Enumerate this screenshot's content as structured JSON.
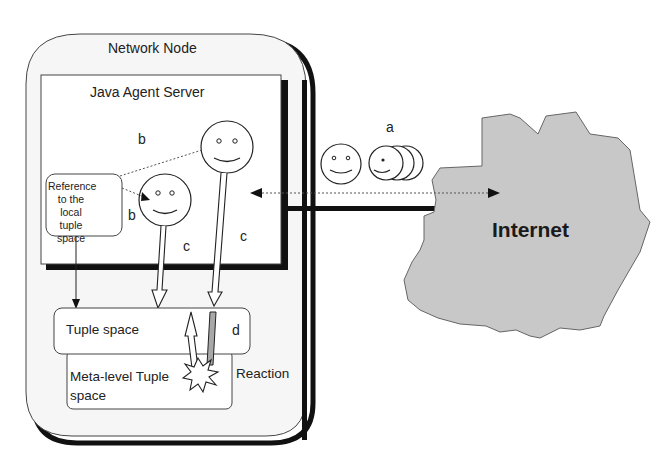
{
  "diagram": {
    "network_node": {
      "label": "Network Node"
    },
    "java_agent_server": {
      "label": "Java Agent Server"
    },
    "reference_box": {
      "label": "Reference to the local tuple space"
    },
    "tuple_space": {
      "label": "Tuple space"
    },
    "meta_level_tuple_space": {
      "label": "Meta-level Tuple space"
    },
    "reaction": {
      "label": "Reaction"
    },
    "internet": {
      "label": "Internet",
      "fill": "#c8c8c8"
    },
    "step_labels": {
      "a": "a",
      "b1": "b",
      "b2": "b",
      "c1": "c",
      "c2": "c",
      "d": "d"
    },
    "agents": [
      {
        "name": "agent-large",
        "role": "mobile agent in server"
      },
      {
        "name": "agent-small",
        "role": "agent using tuple space reference"
      },
      {
        "name": "agent-migrating",
        "role": "agent moving to/from Internet"
      }
    ],
    "colors": {
      "line": "#1a1a1a",
      "node_bg": "#f7f7f7",
      "internet": "#c8c8c8",
      "arrow_shaded": "#a8a8a8"
    }
  }
}
